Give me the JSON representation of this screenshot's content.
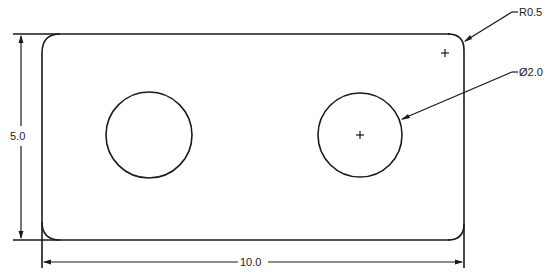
{
  "drawing": {
    "title": "Plate with two holes",
    "part": {
      "width": 10.0,
      "height": 5.0,
      "corner_radius": 0.5,
      "hole_diameter": 2.0,
      "hole_count": 2
    },
    "dimensions": {
      "height_label": "5.0",
      "width_label": "10.0",
      "radius_label": "R0.5",
      "diameter_label": "Ø2.0"
    },
    "colors": {
      "line": "#1a1a1a",
      "background": "#ffffff"
    }
  }
}
